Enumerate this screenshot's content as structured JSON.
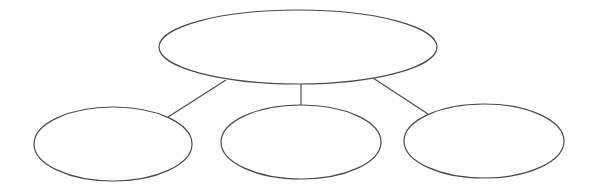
{
  "diagram": {
    "type": "tree",
    "colors": {
      "stroke": "#4a4a4a",
      "fill": "#ffffff",
      "background": "#ffffff"
    },
    "nodes": [
      {
        "id": "root",
        "shape": "ellipse",
        "label": ""
      },
      {
        "id": "child-left",
        "shape": "ellipse",
        "label": ""
      },
      {
        "id": "child-middle",
        "shape": "ellipse",
        "label": ""
      },
      {
        "id": "child-right",
        "shape": "ellipse",
        "label": ""
      }
    ],
    "edges": [
      {
        "from": "root",
        "to": "child-left"
      },
      {
        "from": "root",
        "to": "child-middle"
      },
      {
        "from": "root",
        "to": "child-right"
      }
    ]
  }
}
